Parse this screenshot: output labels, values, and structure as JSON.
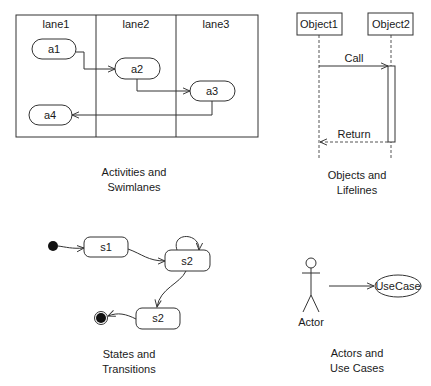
{
  "activities": {
    "caption_line1": "Activities and",
    "caption_line2": "Swimlanes",
    "lanes": [
      {
        "label": "lane1"
      },
      {
        "label": "lane2"
      },
      {
        "label": "lane3"
      }
    ],
    "nodes": [
      {
        "label": "a1"
      },
      {
        "label": "a2"
      },
      {
        "label": "a3"
      },
      {
        "label": "a4"
      }
    ]
  },
  "sequence": {
    "caption_line1": "Objects and",
    "caption_line2": "Lifelines",
    "objects": [
      {
        "label": "Object1"
      },
      {
        "label": "Object2"
      }
    ],
    "messages": [
      {
        "label": "Call"
      },
      {
        "label": "Return"
      }
    ]
  },
  "states": {
    "caption_line1": "States and",
    "caption_line2": "Transitions",
    "nodes": [
      {
        "label": "s1"
      },
      {
        "label": "s2"
      },
      {
        "label": "s2"
      }
    ]
  },
  "usecases": {
    "caption_line1": "Actors and",
    "caption_line2": "Use Cases",
    "actor_label": "Actor",
    "usecase_label": "UseCase"
  },
  "colors": {
    "stroke": "#333333",
    "background": "#ffffff",
    "text": "#1a1a1a"
  }
}
